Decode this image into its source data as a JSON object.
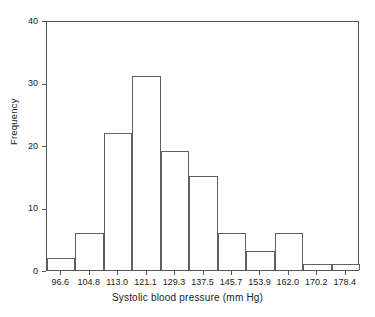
{
  "chart_data": {
    "type": "bar",
    "title": "",
    "xlabel": "Systolic blood pressure (mm Hg)",
    "ylabel": "Frequency",
    "categories": [
      "96.6",
      "104.8",
      "113.0",
      "121.1",
      "129.3",
      "137.5",
      "145.7",
      "153.9",
      "162.0",
      "170.2",
      "178.4"
    ],
    "values": [
      2,
      6,
      22,
      31,
      19,
      15,
      6,
      3,
      6,
      1,
      1
    ],
    "bin_centers": [
      96.6,
      104.8,
      113.0,
      121.1,
      129.3,
      137.5,
      145.7,
      153.9,
      162.0,
      170.2,
      178.4
    ],
    "bin_width": 8.2,
    "xlim": [
      92.5,
      182.5
    ],
    "ylim": [
      0,
      40
    ],
    "yticks": [
      0,
      10,
      20,
      30,
      40
    ],
    "yticklabels": [
      "0",
      "10",
      "20",
      "30",
      "40"
    ],
    "xticks": [
      96.6,
      104.8,
      113.0,
      121.1,
      129.3,
      137.5,
      145.7,
      153.9,
      162.0,
      170.2,
      178.4
    ],
    "xticklabels": [
      "96.6",
      "104.8",
      "113.0",
      "121.1",
      "129.3",
      "137.5",
      "145.7",
      "153.9",
      "162.0",
      "170.2",
      "178.4"
    ],
    "grid": false,
    "legend": false,
    "bar_fill": "#ffffff",
    "bar_edge": "#606060",
    "axis_color": "#555555",
    "background": "#ffffff"
  },
  "axes": {
    "y_title": "Frequency",
    "x_title": "Systolic blood pressure (mm Hg)"
  }
}
